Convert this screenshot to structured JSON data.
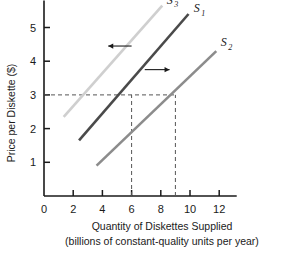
{
  "chart_data": {
    "type": "line",
    "title": "",
    "xlabel_line1": "Quantity of Diskettes Supplied",
    "xlabel_line2": "(billions of constant-quality units per year)",
    "ylabel": "Price per Diskette ($)",
    "xlim": [
      0,
      13.2
    ],
    "ylim": [
      0,
      5.8
    ],
    "xticks": [
      0,
      2,
      4,
      6,
      8,
      10,
      12
    ],
    "xtick_labels": [
      "0",
      "2",
      "4",
      "6",
      "8",
      "10",
      "12"
    ],
    "yticks": [
      1,
      2,
      3,
      4,
      5
    ],
    "ytick_labels": [
      "1",
      "2",
      "3",
      "4",
      "5"
    ],
    "grid": false,
    "legend": "inline-curve-labels",
    "series": [
      {
        "name": "S1",
        "label": "S",
        "subscript": "1",
        "color": "#4a4a4a",
        "width": 2.6,
        "x": [
          2.4,
          9.9
        ],
        "y": [
          1.65,
          5.4
        ],
        "label_x": 10.25,
        "label_y": 5.45,
        "note": "original supply curve, passes through (6, 3)"
      },
      {
        "name": "S2",
        "label": "S",
        "subscript": "2",
        "color": "#8c8c8c",
        "width": 2.6,
        "x": [
          3.6,
          11.8
        ],
        "y": [
          0.9,
          4.3
        ],
        "label_x": 12.1,
        "label_y": 4.45,
        "note": "increase in supply, passes through (9, 3)"
      },
      {
        "name": "S3",
        "label": "S",
        "subscript": "3",
        "color": "#cfcfcf",
        "width": 2.6,
        "x": [
          1.35,
          8.1
        ],
        "y": [
          2.35,
          5.65
        ],
        "label_x": 8.4,
        "label_y": 5.7,
        "note": "decrease in supply, passes through (3, 3)"
      }
    ],
    "reference_lines": [
      {
        "name": "price-level-3",
        "orientation": "horizontal",
        "value": 3,
        "from_x": 0,
        "to_x": 9,
        "style": "dashed"
      },
      {
        "name": "quantity-6",
        "orientation": "vertical",
        "value": 6,
        "from_y": 0,
        "to_y": 3,
        "style": "dashed"
      },
      {
        "name": "quantity-9",
        "orientation": "vertical",
        "value": 9,
        "from_y": 0,
        "to_y": 3,
        "style": "dashed"
      }
    ],
    "annotations": [
      {
        "name": "leftward-shift-arrow",
        "direction": "left",
        "x_start": 6.0,
        "x_end": 4.4,
        "y": 4.45,
        "meaning": "supply decreases, curve shifts left to S3"
      },
      {
        "name": "rightward-shift-arrow",
        "direction": "right",
        "x_start": 6.9,
        "x_end": 8.6,
        "y": 3.75,
        "meaning": "supply increases, curve shifts right to S2"
      }
    ],
    "equilibrium_points": [
      {
        "price": 3,
        "quantity": 6,
        "curve": "S1"
      },
      {
        "price": 3,
        "quantity": 9,
        "curve": "S2"
      },
      {
        "price": 3,
        "quantity": 3,
        "curve": "S3"
      }
    ]
  },
  "colors": {
    "axis": "#1a1a1a",
    "dashed": "#555555",
    "background": "#ffffff",
    "s1": "#4a4a4a",
    "s2": "#8c8c8c",
    "s3": "#cfcfcf"
  }
}
